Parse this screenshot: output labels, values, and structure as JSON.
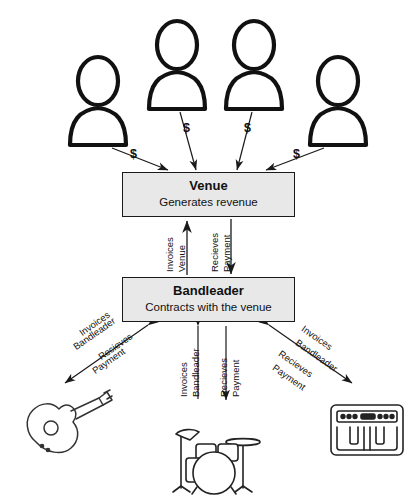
{
  "diagram": {
    "colors": {
      "box_fill": "#e8e8e8",
      "box_border": "#1a1a1a",
      "icon_stroke": "#111111",
      "arrow": "#1a1a1a",
      "background": "#ffffff"
    },
    "nodes": {
      "venue": {
        "title": "Venue",
        "subtitle": "Generates revenue"
      },
      "bandleader": {
        "title": "Bandleader",
        "subtitle": "Contracts with the venue"
      }
    },
    "customers": [
      {
        "icon": "person-icon",
        "money_label": "$"
      },
      {
        "icon": "person-icon",
        "money_label": "$"
      },
      {
        "icon": "person-icon",
        "money_label": "$"
      },
      {
        "icon": "person-icon",
        "money_label": "$"
      }
    ],
    "venue_bandleader_links": {
      "up": {
        "line1": "Invoices",
        "line2": "Venue"
      },
      "down": {
        "line1": "Recieves",
        "line2": "Payment"
      }
    },
    "musicians": [
      {
        "icon": "guitar-icon",
        "name": "guitar",
        "out": {
          "line1": "Invoices",
          "line2": "Bandleader"
        },
        "in": {
          "line1": "Recieves",
          "line2": "Payment"
        }
      },
      {
        "icon": "drums-icon",
        "name": "drums",
        "out": {
          "line1": "Invoices",
          "line2": "Bandleader"
        },
        "in": {
          "line1": "Recieves",
          "line2": "Payment"
        }
      },
      {
        "icon": "keyboard-icon",
        "name": "keyboard",
        "out": {
          "line1": "Invoices",
          "line2": "Bandleader"
        },
        "in": {
          "line1": "Recieves",
          "line2": "Payment"
        }
      }
    ]
  }
}
